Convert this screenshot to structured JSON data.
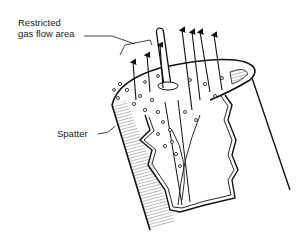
{
  "diagram": {
    "labels": {
      "restricted_line1": "Restricted",
      "restricted_line2": "gas flow area",
      "spatter": "Spatter"
    },
    "colors": {
      "ink": "#111111",
      "background": "#ffffff",
      "shade": "#9a9a9a"
    }
  }
}
